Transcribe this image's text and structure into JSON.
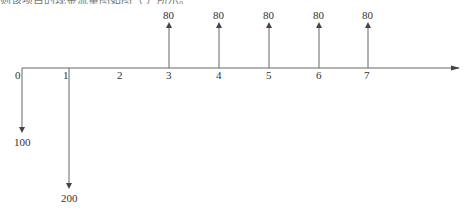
{
  "caption": "则该项目的现金流量图如图（ ）所示。",
  "diagram": {
    "type": "cash-flow-diagram",
    "axis": {
      "y": 68,
      "x_start": 22,
      "x_end": 460,
      "color": "#555555"
    },
    "periods": [
      {
        "label": "0",
        "x": 22
      },
      {
        "label": "1",
        "x": 69
      },
      {
        "label": "2",
        "x": 120
      },
      {
        "label": "3",
        "x": 169
      },
      {
        "label": "4",
        "x": 219
      },
      {
        "label": "5",
        "x": 269
      },
      {
        "label": "6",
        "x": 319
      },
      {
        "label": "7",
        "x": 368
      }
    ],
    "flows": [
      {
        "period": "0",
        "direction": "out",
        "amount": "100"
      },
      {
        "period": "1",
        "direction": "out",
        "amount": "200"
      },
      {
        "period": "3",
        "direction": "in",
        "amount": "80"
      },
      {
        "period": "4",
        "direction": "in",
        "amount": "80"
      },
      {
        "period": "5",
        "direction": "in",
        "amount": "80"
      },
      {
        "period": "6",
        "direction": "in",
        "amount": "80"
      },
      {
        "period": "7",
        "direction": "in",
        "amount": "80"
      }
    ]
  }
}
